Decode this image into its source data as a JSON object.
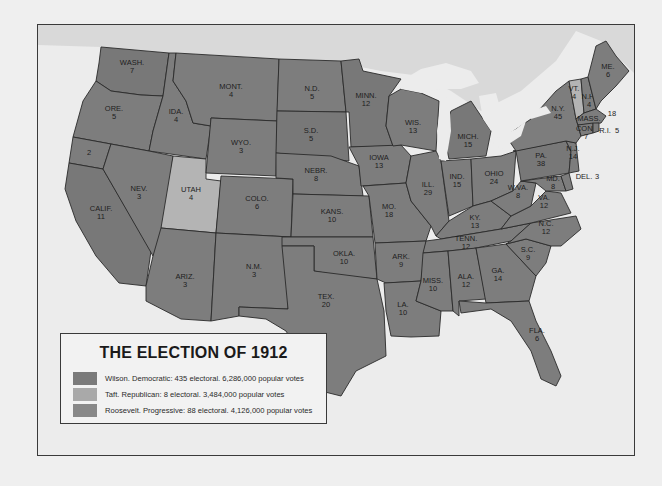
{
  "map": {
    "colors": {
      "wilson": "#7d7d7d",
      "taft": "#b4b4b4",
      "roosevelt": "#787878",
      "background": "#ececec",
      "canada": "#d9d9d9"
    },
    "states": [
      {
        "abbr": "WASH.",
        "ev": "7",
        "party": "roosevelt"
      },
      {
        "abbr": "ORE.",
        "ev": "5",
        "party": "wilson"
      },
      {
        "abbr": "CALIF.",
        "ev": "11",
        "party": "roosevelt"
      },
      {
        "abbr": "",
        "ev": "2",
        "party": "wilson"
      },
      {
        "abbr": "IDA.",
        "ev": "4",
        "party": "wilson"
      },
      {
        "abbr": "NEV.",
        "ev": "3",
        "party": "wilson"
      },
      {
        "abbr": "UTAH",
        "ev": "4",
        "party": "taft"
      },
      {
        "abbr": "ARIZ.",
        "ev": "3",
        "party": "wilson"
      },
      {
        "abbr": "MONT.",
        "ev": "4",
        "party": "wilson"
      },
      {
        "abbr": "WYO.",
        "ev": "3",
        "party": "wilson"
      },
      {
        "abbr": "COLO.",
        "ev": "6",
        "party": "wilson"
      },
      {
        "abbr": "N.M.",
        "ev": "3",
        "party": "wilson"
      },
      {
        "abbr": "N.D.",
        "ev": "5",
        "party": "wilson"
      },
      {
        "abbr": "S.D.",
        "ev": "5",
        "party": "roosevelt"
      },
      {
        "abbr": "NEBR.",
        "ev": "8",
        "party": "wilson"
      },
      {
        "abbr": "KANS.",
        "ev": "10",
        "party": "wilson"
      },
      {
        "abbr": "OKLA.",
        "ev": "10",
        "party": "wilson"
      },
      {
        "abbr": "TEX.",
        "ev": "20",
        "party": "wilson"
      },
      {
        "abbr": "MINN.",
        "ev": "12",
        "party": "roosevelt"
      },
      {
        "abbr": "IOWA",
        "ev": "13",
        "party": "wilson"
      },
      {
        "abbr": "MO.",
        "ev": "18",
        "party": "wilson"
      },
      {
        "abbr": "ARK.",
        "ev": "9",
        "party": "wilson"
      },
      {
        "abbr": "LA.",
        "ev": "10",
        "party": "wilson"
      },
      {
        "abbr": "WIS.",
        "ev": "13",
        "party": "wilson"
      },
      {
        "abbr": "ILL.",
        "ev": "29",
        "party": "wilson"
      },
      {
        "abbr": "MICH.",
        "ev": "15",
        "party": "roosevelt"
      },
      {
        "abbr": "IND.",
        "ev": "15",
        "party": "wilson"
      },
      {
        "abbr": "OHIO",
        "ev": "24",
        "party": "wilson"
      },
      {
        "abbr": "KY.",
        "ev": "13",
        "party": "wilson"
      },
      {
        "abbr": "TENN.",
        "ev": "12",
        "party": "wilson"
      },
      {
        "abbr": "MISS.",
        "ev": "10",
        "party": "wilson"
      },
      {
        "abbr": "ALA.",
        "ev": "12",
        "party": "wilson"
      },
      {
        "abbr": "GA.",
        "ev": "14",
        "party": "wilson"
      },
      {
        "abbr": "FLA.",
        "ev": "6",
        "party": "wilson"
      },
      {
        "abbr": "S.C.",
        "ev": "9",
        "party": "wilson"
      },
      {
        "abbr": "N.C.",
        "ev": "12",
        "party": "wilson"
      },
      {
        "abbr": "VA.",
        "ev": "12",
        "party": "wilson"
      },
      {
        "abbr": "W.VA.",
        "ev": "8",
        "party": "wilson"
      },
      {
        "abbr": "MD.",
        "ev": "8",
        "party": "wilson"
      },
      {
        "abbr": "DEL.",
        "ev": "3",
        "party": "wilson"
      },
      {
        "abbr": "PA.",
        "ev": "38",
        "party": "roosevelt"
      },
      {
        "abbr": "N.J.",
        "ev": "14",
        "party": "wilson"
      },
      {
        "abbr": "N.Y.",
        "ev": "45",
        "party": "wilson"
      },
      {
        "abbr": "CONN.",
        "ev": "7",
        "party": "wilson"
      },
      {
        "abbr": "R.I.",
        "ev": "5",
        "party": "wilson"
      },
      {
        "abbr": "MASS.",
        "ev": "18",
        "party": "wilson"
      },
      {
        "abbr": "VT.",
        "ev": "4",
        "party": "taft"
      },
      {
        "abbr": "N.H.",
        "ev": "4",
        "party": "wilson"
      },
      {
        "abbr": "ME.",
        "ev": "6",
        "party": "wilson"
      }
    ]
  },
  "legend": {
    "title": "THE ELECTION OF 1912",
    "items": [
      {
        "label": "Wilson. Democratic: 435 electoral. 6,286,000 popular votes",
        "color": "#7a7a7a"
      },
      {
        "label": "Taft. Republican: 8 electoral. 3,484,000 popular votes",
        "color": "#a9a9a9"
      },
      {
        "label": "Roosevelt. Progressive: 88 electoral. 4,126,000 popular votes",
        "color": "#888888"
      }
    ]
  }
}
